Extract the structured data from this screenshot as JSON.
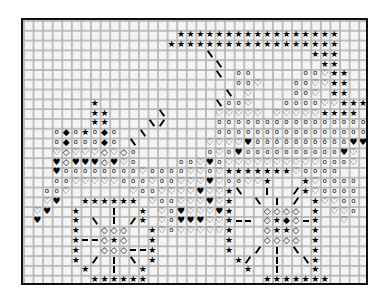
{
  "pattern": {
    "title": "Carriage cross-stitch chart",
    "columns": 36,
    "rows": 27,
    "legend": {
      "*": "filled-star",
      "o": "small-circle",
      "h": "open-heart",
      "H": "filled-heart",
      "d": "open-diamond",
      "D": "filled-diamond",
      "=": "barred-circle",
      "-": "dash-horizontal",
      "|": "dash-vertical",
      "/": "dash-diagonal-up",
      "\\": "dash-diagonal-down",
      ".": "empty"
    },
    "glyphs": {
      "*": "★",
      "o": "o",
      "h": "♡",
      "H": "♥",
      "d": "◇",
      "D": "◆",
      "=": "ō"
    },
    "grid_rows": [
      "....................................",
      "................*****************...",
      "...............******************...",
      "...................\\..........***...",
      "....................\\..........**...",
      "....................\\.oo.....ooh**...",
      "......................ooh...oohh**..",
      ".....................\\.h....ooh.**..",
      ".......*............\\ooh...oooohh***",
      ".......**.....\\.....hhhhh.hhhhh****.",
      ".......**....\\/.....oooooooooooooooo",
      "...oDo*oDo..\\.......oooooooooooooooo",
      "...oDoooDo.\\.......hhhhH==========HHH",
      "...hdhhhdhdo.......ohoHooooooooooHh.",
      "...HdHHHdHho....oohHohhhhhhhhhhoooh.",
      "...Hoooooooohoooohhoh*******hoooo...",
      "...oohhhhhooohoohhhHhoohh*...*hoooo.",
      "..ooh......hoohhhhHhh*\\..|../*hoooo.",
      "..hH..******.hoohhhHh*..\\.|./.*hhoo.",
      ".hH..*...|..*.hoHhhhH*...dddd.*.hho.",
      ".H...*.\\.|./*.hoHHHhh*--.d*Dd-*..h..",
      ".....*..ddd..*hohhhhh*...d**d.*.....",
      ".....*--d*d..*.......*...dddd.*.....",
      ".....*..ddd--*.......*../.|.\\.*.....",
      ".....*./.|.\\.*........*/..|..\\*.....",
      "......*..|..*..........*..|...*.....",
      ".......******............*******....."
    ]
  }
}
